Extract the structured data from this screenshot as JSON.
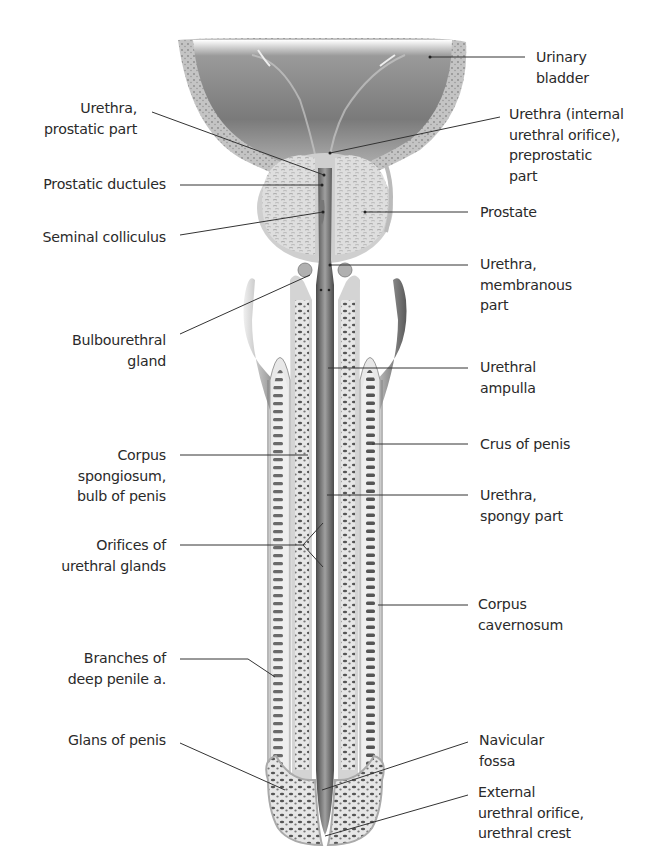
{
  "figure": {
    "colors": {
      "tissue_light": "#e4e4e4",
      "tissue_mid": "#b8b8b8",
      "tissue_dark": "#5a5a5a",
      "leader": "#333333",
      "text": "#2a2a2a"
    }
  },
  "labels_left": [
    {
      "id": "urethra-prostatic-part",
      "text": "Urethra,\nprostatic part"
    },
    {
      "id": "prostatic-ductules",
      "text": "Prostatic ductules"
    },
    {
      "id": "seminal-colliculus",
      "text": "Seminal colliculus"
    },
    {
      "id": "bulbourethral-gland",
      "text": "Bulbourethral\ngland"
    },
    {
      "id": "corpus-spongiosum",
      "text": "Corpus\nspongiosum,\nbulb of penis"
    },
    {
      "id": "orifices-urethral-glands",
      "text": "Orifices of\nurethral glands"
    },
    {
      "id": "branches-deep-penile-a",
      "text": "Branches of\ndeep penile a."
    },
    {
      "id": "glans-of-penis",
      "text": "Glans of penis"
    }
  ],
  "labels_right": [
    {
      "id": "urinary-bladder",
      "text": "Urinary\nbladder"
    },
    {
      "id": "urethra-internal-orifice",
      "text": "Urethra (internal\nurethral orifice),\npreprostatic\npart"
    },
    {
      "id": "prostate",
      "text": "Prostate"
    },
    {
      "id": "urethra-membranous-part",
      "text": "Urethra,\nmembranous\npart"
    },
    {
      "id": "urethral-ampulla",
      "text": "Urethral\nampulla"
    },
    {
      "id": "crus-of-penis",
      "text": "Crus of penis"
    },
    {
      "id": "urethra-spongy-part",
      "text": "Urethra,\nspongy part"
    },
    {
      "id": "corpus-cavernosum",
      "text": "Corpus\ncavernosum"
    },
    {
      "id": "navicular-fossa",
      "text": "Navicular\nfossa"
    },
    {
      "id": "external-urethral-orifice",
      "text": "External\nurethral orifice,\nurethral crest"
    }
  ]
}
